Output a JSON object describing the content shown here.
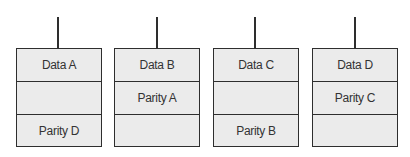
{
  "diagram": {
    "type": "raid-parity-layout",
    "disks": [
      {
        "cells": [
          "Data A",
          "",
          "Parity D"
        ]
      },
      {
        "cells": [
          "Data B",
          "Parity A",
          ""
        ]
      },
      {
        "cells": [
          "Data C",
          "",
          "Parity B"
        ]
      },
      {
        "cells": [
          "Data D",
          "Parity C",
          ""
        ]
      }
    ],
    "colors": {
      "fill": "#ebebeb",
      "stroke": "#2e2e2e",
      "text": "#333333"
    }
  }
}
